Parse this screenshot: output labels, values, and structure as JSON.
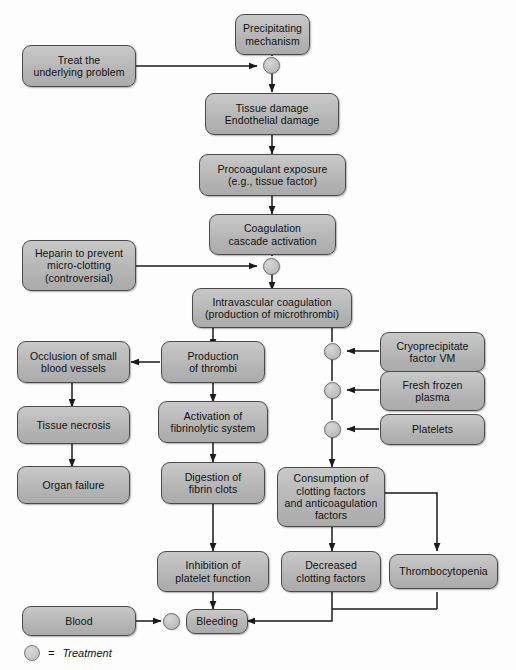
{
  "figure": {
    "box_fill": "#b8b8b8",
    "box_border": "#4a4a4a",
    "line_color": "#1a1a1a",
    "treatment_node_fill": "#c6c6c6"
  },
  "nodes": {
    "precipitating_mechanism": "Precipitating\nmechanism",
    "treat_underlying_problem": "Treat the\nunderlying problem",
    "tissue_damage": "Tissue damage\nEndothelial damage",
    "procoagulant_exposure": "Procoagulant exposure\n(e.g., tissue factor)",
    "coagulation_cascade": "Coagulation\ncascade activation",
    "heparin": "Heparin to prevent\nmicro-clotting\n(controversial)",
    "intravascular_coagulation": "Intravascular coagulation\n(production of microthrombi)",
    "occlusion": "Occlusion of small\nblood vessels",
    "production_thrombi": "Production\nof thrombi",
    "cryoprecipitate": "Cryoprecipitate\nfactor VM",
    "tissue_necrosis": "Tissue necrosis",
    "activation_fibrinolytic": "Activation of\nfibrinolytic system",
    "fresh_frozen_plasma": "Fresh frozen\nplasma",
    "organ_failure": "Organ failure",
    "digestion_fibrin": "Digestion of\nfibrin clots",
    "platelets": "Platelets",
    "consumption": "Consumption of\nclotting factors\nand anticoagulation\nfactors",
    "inhibition_platelet": "Inhibition of\nplatelet function",
    "decreased_clotting": "Decreased\nclotting factors",
    "thrombocytopenia": "Thrombocytopenia",
    "blood": "Blood",
    "bleeding": "Bleeding"
  },
  "legend": {
    "symbol": "treatment-circle-icon",
    "equals": "=",
    "label": "Treatment"
  }
}
